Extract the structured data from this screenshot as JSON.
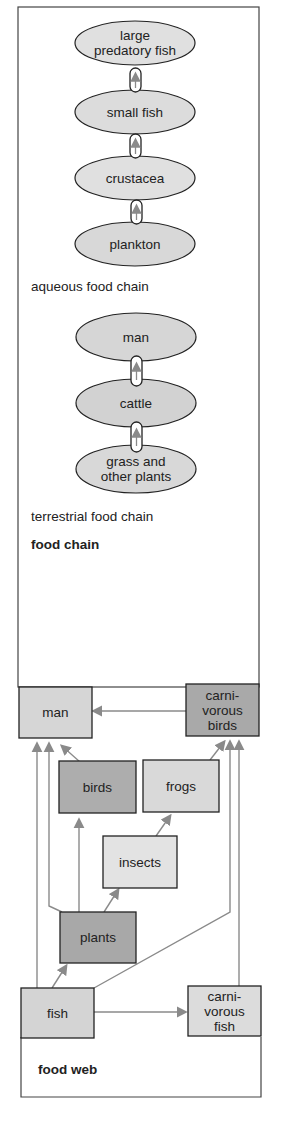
{
  "food_chain": {
    "title": "food chain",
    "aqueous": {
      "caption": "aqueous food chain",
      "nodes": [
        "large\npredatory fish",
        "small fish",
        "crustacea",
        "plankton"
      ]
    },
    "terrestrial": {
      "caption": "terrestrial food chain",
      "nodes": [
        "man",
        "cattle",
        "grass and\nother plants"
      ]
    }
  },
  "food_web": {
    "title": "food web",
    "nodes": {
      "man": "man",
      "carnivorous_birds": "carni-\nvorous\nbirds",
      "birds": "birds",
      "frogs": "frogs",
      "insects": "insects",
      "plants": "plants",
      "fish": "fish",
      "carnivorous_fish": "carni-\nvorous\nfish"
    }
  },
  "colors": {
    "light_fill": "#dedede",
    "dark_fill": "#b4b4b4",
    "arrow": "#8a8a8a",
    "border": "#333333"
  }
}
